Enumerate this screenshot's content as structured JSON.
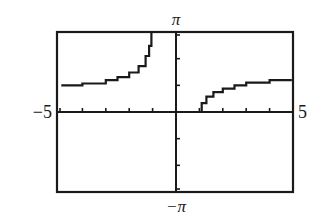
{
  "chart_data": {
    "type": "line",
    "title": "",
    "xlabel": "",
    "ylabel": "",
    "xlim": [
      -5,
      5
    ],
    "ylim": [
      -3.14159,
      3.14159
    ],
    "x_tick_labels": {
      "min": "-5",
      "max": "5"
    },
    "y_tick_labels": {
      "min": "−π",
      "max": "π"
    },
    "x_ticks": [
      -4,
      -3,
      -2,
      -1,
      1,
      2,
      3,
      4,
      5
    ],
    "y_ticks": [
      -2,
      -1,
      1,
      2
    ],
    "grid": false,
    "legend": null,
    "asymptote_x": -1,
    "series": [
      {
        "name": "left-branch",
        "x": [
          -4.9,
          -4.0,
          -3.0,
          -2.5,
          -2.0,
          -1.6,
          -1.3,
          -1.15,
          -1.05
        ],
        "y": [
          1.05,
          1.12,
          1.25,
          1.37,
          1.55,
          1.8,
          2.2,
          2.6,
          3.1
        ]
      },
      {
        "name": "right-branch",
        "x": [
          1.0,
          1.1,
          1.3,
          1.6,
          2.0,
          2.5,
          3.0,
          4.0,
          4.9
        ],
        "y": [
          0.0,
          0.35,
          0.6,
          0.78,
          0.92,
          1.05,
          1.15,
          1.25,
          1.3
        ]
      }
    ]
  },
  "labels": {
    "y_max": "π",
    "y_min": "−π",
    "x_min": "−5",
    "x_max": "5"
  }
}
